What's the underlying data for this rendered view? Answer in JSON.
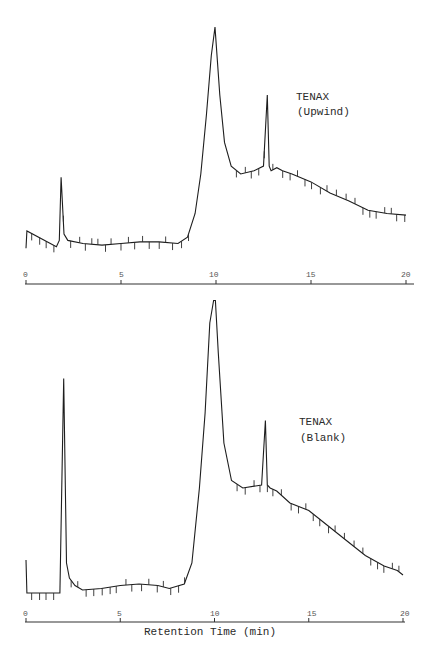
{
  "chart_data": [
    {
      "type": "line",
      "title": "TENAX (Upwind)",
      "label_line1": "TENAX",
      "label_line2": "(Upwind)",
      "xlabel": "",
      "ylabel": "",
      "xlim": [
        0,
        20
      ],
      "x_ticks": [
        "0",
        "5",
        "10",
        "15",
        "20"
      ],
      "grid": false,
      "series": [
        {
          "name": "Upwind",
          "x": [
            0,
            0.05,
            1.6,
            1.75,
            1.85,
            2.0,
            2.2,
            3,
            4,
            5,
            6,
            7,
            8,
            8.5,
            8.9,
            9.2,
            9.5,
            9.75,
            9.95,
            10.2,
            10.45,
            10.8,
            11.3,
            12,
            12.5,
            12.7,
            12.8,
            12.9,
            13.2,
            13.5,
            14,
            15,
            16,
            17,
            18,
            19,
            20
          ],
          "y": [
            3,
            14,
            4,
            8,
            48,
            12,
            8,
            6,
            5,
            6,
            7,
            7,
            6,
            10,
            25,
            50,
            88,
            125,
            143,
            100,
            70,
            55,
            50,
            52,
            55,
            100,
            55,
            52,
            54,
            52,
            50,
            45,
            38,
            33,
            27,
            25,
            24
          ]
        }
      ]
    },
    {
      "type": "line",
      "title": "TENAX (Blank)",
      "label_line1": "TENAX",
      "label_line2": "(Blank)",
      "xlabel": "Retention Time (min)",
      "ylabel": "",
      "xlim": [
        0,
        20
      ],
      "x_ticks": [
        "0",
        "5",
        "10",
        "15",
        "20"
      ],
      "grid": false,
      "series": [
        {
          "name": "Blank",
          "x": [
            0,
            0.05,
            1.8,
            2.0,
            2.15,
            2.3,
            2.6,
            3,
            4,
            5,
            6,
            7,
            7.6,
            8.4,
            8.8,
            9.2,
            9.5,
            9.75,
            9.95,
            10.05,
            10.2,
            10.5,
            10.9,
            11.5,
            12.5,
            12.7,
            12.8,
            12.95,
            13.3,
            14,
            15,
            16,
            17,
            18,
            19,
            19.7,
            20
          ],
          "y": [
            22,
            0,
            0,
            143,
            20,
            10,
            5,
            2,
            3,
            5,
            6,
            5,
            3,
            6,
            20,
            70,
            120,
            180,
            195,
            195,
            160,
            100,
            75,
            70,
            72,
            115,
            72,
            70,
            68,
            60,
            55,
            45,
            35,
            25,
            18,
            15,
            12
          ]
        }
      ]
    }
  ],
  "axis": {
    "top_ticks": [
      "0",
      "5",
      "10",
      "15",
      "20"
    ],
    "bottom_ticks": [
      "0",
      "5",
      "10",
      "15",
      "20"
    ],
    "xlabel": "Retention Time (min)"
  },
  "labels": {
    "top_line1": "TENAX",
    "top_line2": "(Upwind)",
    "bottom_line1": "TENAX",
    "bottom_line2": "(Blank)"
  }
}
